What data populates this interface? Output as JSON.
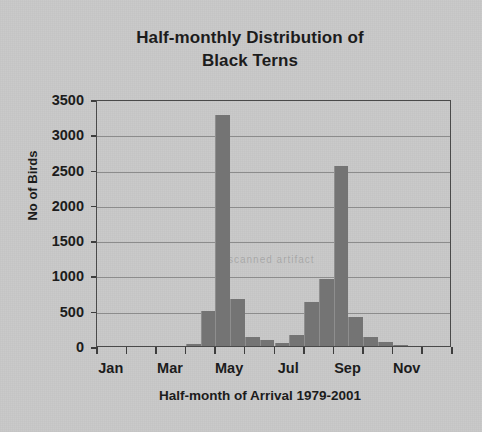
{
  "chart_data": {
    "type": "bar",
    "title": "Half-monthly Distribution of Black Terns",
    "title_lines": [
      "Half-monthly Distribution of",
      "Black Terns"
    ],
    "xlabel": "Half-month of Arrival 1979-2001",
    "ylabel": "No of Birds",
    "ylim": [
      0,
      3500
    ],
    "ytick_step": 500,
    "yticks": [
      3500,
      3000,
      2500,
      2000,
      1500,
      1000,
      500,
      0
    ],
    "ytick_labels": [
      "3500",
      "3000",
      "2500",
      "2000",
      "1500",
      "1000",
      "500",
      "0"
    ],
    "grid": true,
    "legend": false,
    "bar_color": "#747474",
    "plot_border_color": "#4a4a4a",
    "gridline_color": "#8c8c8c",
    "background_color": "#c8c8c8",
    "text_color": "#1c1c1c",
    "categories": [
      "Jan 1",
      "Jan 2",
      "Feb 1",
      "Feb 2",
      "Mar 1",
      "Mar 2",
      "Apr 1",
      "Apr 2",
      "May 1",
      "May 2",
      "Jun 1",
      "Jun 2",
      "Jul 1",
      "Jul 2",
      "Aug 1",
      "Aug 2",
      "Sep 1",
      "Sep 2",
      "Oct 1",
      "Oct 2",
      "Nov 1",
      "Nov 2",
      "Dec 1",
      "Dec 2"
    ],
    "values": [
      0,
      0,
      0,
      0,
      0,
      0,
      30,
      490,
      3280,
      660,
      130,
      90,
      40,
      150,
      620,
      950,
      2550,
      410,
      130,
      50,
      20,
      0,
      0,
      0
    ],
    "xtick_labels": [
      "Jan",
      "Mar",
      "May",
      "Jul",
      "Sep",
      "Nov"
    ],
    "xtick_category_index": [
      0,
      4,
      8,
      12,
      16,
      20
    ],
    "annotations": [
      "Half-monthly Distribution of Black Terns"
    ],
    "ghost_text": "scanned artifact"
  },
  "figure": {
    "title_line_1": "Half-monthly Distribution of",
    "title_line_2": "Black Terns",
    "y_axis_title": "No of Birds",
    "x_axis_title": "Half-month of Arrival 1979-2001"
  }
}
